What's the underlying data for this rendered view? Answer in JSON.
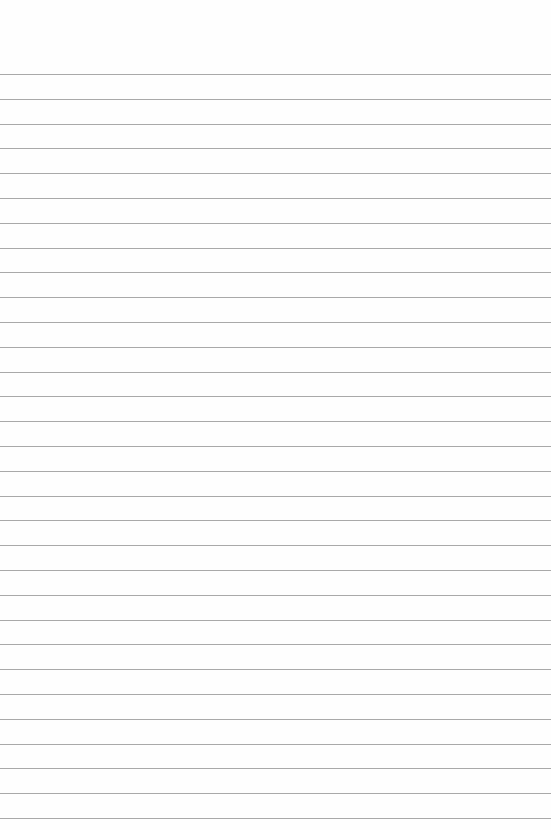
{
  "paper": {
    "type": "lined-paper",
    "line_color": "#a9a9a9",
    "background": "#fefefe",
    "line_count": 31,
    "first_line_y": 74,
    "line_spacing": 24.8
  }
}
